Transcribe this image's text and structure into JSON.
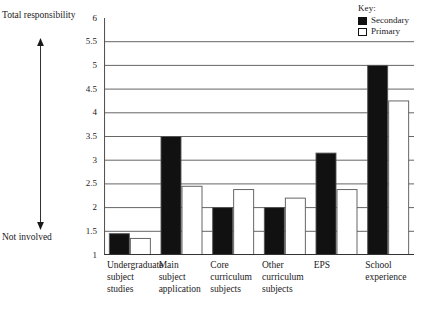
{
  "legend": {
    "title": "Key:",
    "entries": [
      {
        "label": "Secondary",
        "swatch": "filled-black-square",
        "color": "#111111"
      },
      {
        "label": "Primary",
        "swatch": "hollow-white-square",
        "color": "#ffffff"
      }
    ]
  },
  "axis_annotation": {
    "top_label": "Total responsibility",
    "bottom_label": "Not involved",
    "arrow_icon": "double-headed-vertical-arrow"
  },
  "chart_data": {
    "type": "bar",
    "title": "",
    "subtitle": "",
    "xlabel": "",
    "ylabel": "",
    "grid": true,
    "legend_position": "top-right",
    "ylim": [
      1,
      6
    ],
    "ytick_step": 0.5,
    "yticks": [
      "1",
      "1.5",
      "2",
      "2.5",
      "3",
      "3.5",
      "4",
      "4.5",
      "5",
      "5.5",
      "6"
    ],
    "categories": [
      "Undergraduate subject studies",
      "Main subject application",
      "Core curriculum subjects",
      "Other curriculum subjects",
      "EPS",
      "School experience"
    ],
    "category_label_lines": [
      [
        "Undergraduate",
        "subject",
        "studies"
      ],
      [
        "Main",
        "subject",
        "application"
      ],
      [
        "Core",
        "curriculum",
        "subjects"
      ],
      [
        "Other",
        "curriculum",
        "subjects"
      ],
      [
        "EPS"
      ],
      [
        "School",
        "experience"
      ]
    ],
    "series": [
      {
        "name": "Secondary",
        "color": "#111111",
        "values": [
          1.45,
          3.5,
          2.0,
          2.0,
          3.15,
          5.0
        ]
      },
      {
        "name": "Primary",
        "color": "#ffffff",
        "values": [
          1.35,
          2.45,
          2.38,
          2.2,
          2.38,
          4.25
        ]
      }
    ]
  }
}
